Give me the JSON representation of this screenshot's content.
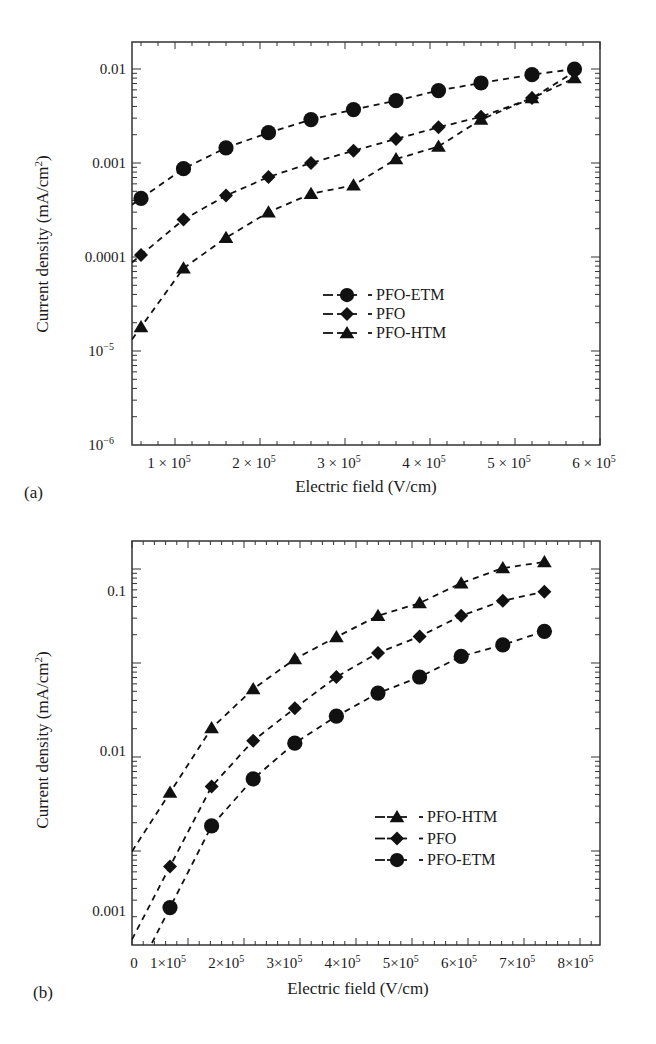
{
  "figure": {
    "panels": [
      "(a)",
      "(b)"
    ]
  },
  "chart_data": [
    {
      "id": "a",
      "type": "scatter",
      "panel_label": "(a)",
      "title": "",
      "xlabel": "Electric field (V/cm)",
      "ylabel": "Current density (mA/cm²)",
      "ylabel_base": "Current density (mA/cm",
      "ylabel_sup": "2",
      "ylabel_tail": ")",
      "xscale": "linear",
      "yscale": "log",
      "xlim": [
        50000,
        600000
      ],
      "ylim": [
        1e-06,
        0.02
      ],
      "grid": false,
      "line_style": "dashed",
      "x_ticks": [
        {
          "value": 100000,
          "mantissa": "1 × 10",
          "exp": "5"
        },
        {
          "value": 200000,
          "mantissa": "2 × 10",
          "exp": "5"
        },
        {
          "value": 300000,
          "mantissa": "3 × 10",
          "exp": "5"
        },
        {
          "value": 400000,
          "mantissa": "4 × 10",
          "exp": "5"
        },
        {
          "value": 500000,
          "mantissa": "5 × 10",
          "exp": "5"
        },
        {
          "value": 600000,
          "mantissa": "6 × 10",
          "exp": "5"
        }
      ],
      "y_ticks": [
        {
          "value": 0.01,
          "label": "0.01"
        },
        {
          "value": 0.001,
          "label": "0.001"
        },
        {
          "value": 0.0001,
          "label": "0.0001"
        },
        {
          "value": 1e-05,
          "mantissa": "10",
          "exp": "−5"
        },
        {
          "value": 1e-06,
          "mantissa": "10",
          "exp": "−6"
        }
      ],
      "legend": {
        "position": "center",
        "entries": [
          {
            "name": "PFO-ETM",
            "marker": "circle"
          },
          {
            "name": "PFO",
            "marker": "diamond"
          },
          {
            "name": "PFO-HTM",
            "marker": "triangle"
          }
        ]
      },
      "series": [
        {
          "name": "PFO-ETM",
          "marker": "circle",
          "x": [
            60000,
            110000,
            160000,
            210000,
            260000,
            310000,
            360000,
            410000,
            460000,
            520000,
            570000
          ],
          "values": [
            0.00042,
            0.00087,
            0.00145,
            0.0021,
            0.0029,
            0.0037,
            0.0046,
            0.0059,
            0.0071,
            0.0087,
            0.01
          ]
        },
        {
          "name": "PFO",
          "marker": "diamond",
          "x": [
            60000,
            110000,
            160000,
            210000,
            260000,
            310000,
            360000,
            410000,
            460000,
            520000,
            570000
          ],
          "values": [
            0.000105,
            0.00025,
            0.00045,
            0.00071,
            0.001,
            0.00135,
            0.0018,
            0.0024,
            0.0031,
            0.0049,
            0.0093
          ]
        },
        {
          "name": "PFO-HTM",
          "marker": "triangle",
          "x": [
            60000,
            110000,
            160000,
            210000,
            260000,
            310000,
            360000,
            410000,
            460000,
            520000,
            570000
          ],
          "values": [
            1.8e-05,
            7.6e-05,
            0.00016,
            0.0003,
            0.00047,
            0.00058,
            0.0011,
            0.0015,
            0.0029,
            0.0049,
            0.008
          ]
        }
      ]
    },
    {
      "id": "b",
      "type": "scatter",
      "panel_label": "(b)",
      "title": "",
      "xlabel": "Electric field (V/cm)",
      "ylabel": "Current density (mA/cm²)",
      "ylabel_base": "Current density (mA/cm",
      "ylabel_sup": "2",
      "ylabel_tail": ")",
      "xscale": "linear",
      "yscale": "log",
      "xlim": [
        0,
        840000
      ],
      "ylim": [
        0.0006,
        0.2
      ],
      "grid": false,
      "line_style": "dashed",
      "x_ticks": [
        {
          "value": 0,
          "label": "0"
        },
        {
          "value": 100000,
          "mantissa": "1×10",
          "exp": "5"
        },
        {
          "value": 200000,
          "mantissa": "2×10",
          "exp": "5"
        },
        {
          "value": 300000,
          "mantissa": "3×10",
          "exp": "5"
        },
        {
          "value": 400000,
          "mantissa": "4×10",
          "exp": "5"
        },
        {
          "value": 500000,
          "mantissa": "5×10",
          "exp": "5"
        },
        {
          "value": 600000,
          "mantissa": "6×10",
          "exp": "5"
        },
        {
          "value": 700000,
          "mantissa": "7×10",
          "exp": "5"
        },
        {
          "value": 800000,
          "mantissa": "8×10",
          "exp": "5"
        }
      ],
      "y_ticks": [
        {
          "value": 0.1,
          "label": "0.1"
        },
        {
          "value": 0.01,
          "label": "0.01"
        },
        {
          "value": 0.001,
          "label": "0.001"
        }
      ],
      "legend": {
        "position": "lower right",
        "entries": [
          {
            "name": "PFO-HTM",
            "marker": "triangle"
          },
          {
            "name": "PFO",
            "marker": "diamond"
          },
          {
            "name": "PFO-ETM",
            "marker": "circle"
          }
        ]
      },
      "series": [
        {
          "name": "PFO-HTM",
          "marker": "triangle",
          "x": [
            100000,
            180000,
            260000,
            340000,
            420000,
            500000,
            580000,
            660000,
            740000,
            820000
          ],
          "values": [
            0.0055,
            0.0139,
            0.0244,
            0.0376,
            0.0516,
            0.07,
            0.084,
            0.112,
            0.139,
            0.152
          ]
        },
        {
          "name": "PFO",
          "marker": "diamond",
          "x": [
            100000,
            180000,
            260000,
            340000,
            420000,
            500000,
            580000,
            660000,
            740000,
            820000
          ],
          "values": [
            0.0019,
            0.006,
            0.0116,
            0.0185,
            0.029,
            0.041,
            0.052,
            0.07,
            0.087,
            0.099
          ]
        },
        {
          "name": "PFO-ETM",
          "marker": "circle",
          "x": [
            100000,
            180000,
            260000,
            340000,
            420000,
            500000,
            580000,
            660000,
            740000,
            820000
          ],
          "values": [
            0.00105,
            0.0034,
            0.0067,
            0.0112,
            0.0165,
            0.023,
            0.029,
            0.039,
            0.046,
            0.056
          ]
        }
      ]
    }
  ]
}
